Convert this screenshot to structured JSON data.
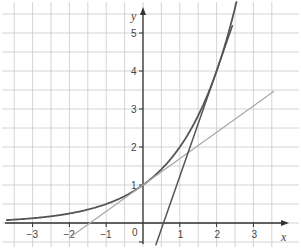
{
  "chart_data": {
    "type": "line",
    "title": "",
    "xlabel": "x",
    "ylabel": "y",
    "xlim": [
      -3.75,
      3.9
    ],
    "ylim": [
      -0.6,
      5.85
    ],
    "grid": true,
    "grid_step": 0.5,
    "x_ticks": [
      -3,
      -2,
      -1,
      0,
      1,
      2,
      3
    ],
    "y_ticks": [
      1,
      2,
      3,
      4,
      5
    ],
    "x_tick_labels": [
      "−3",
      "−2",
      "−1",
      "0",
      "1",
      "2",
      "3"
    ],
    "y_tick_labels": [
      "1",
      "2",
      "3",
      "4",
      "5"
    ],
    "origin_label": "0",
    "series": [
      {
        "name": "curve y = 2^x",
        "kind": "function",
        "expr": "2^x",
        "x_range": [
          -3.7,
          2.54
        ],
        "color": "#555555",
        "width": 1.8
      },
      {
        "name": "tangent at x = 0",
        "kind": "line",
        "points": [
          [
            -2.0,
            -0.386
          ],
          [
            3.55,
            3.46
          ]
        ],
        "color": "#aaaaaa",
        "width": 1.3
      },
      {
        "name": "tangent at x = 2",
        "kind": "line",
        "points": [
          [
            0.35,
            -0.57
          ],
          [
            2.43,
            5.19
          ]
        ],
        "color": "#555555",
        "width": 1.5
      }
    ],
    "annotations": []
  }
}
